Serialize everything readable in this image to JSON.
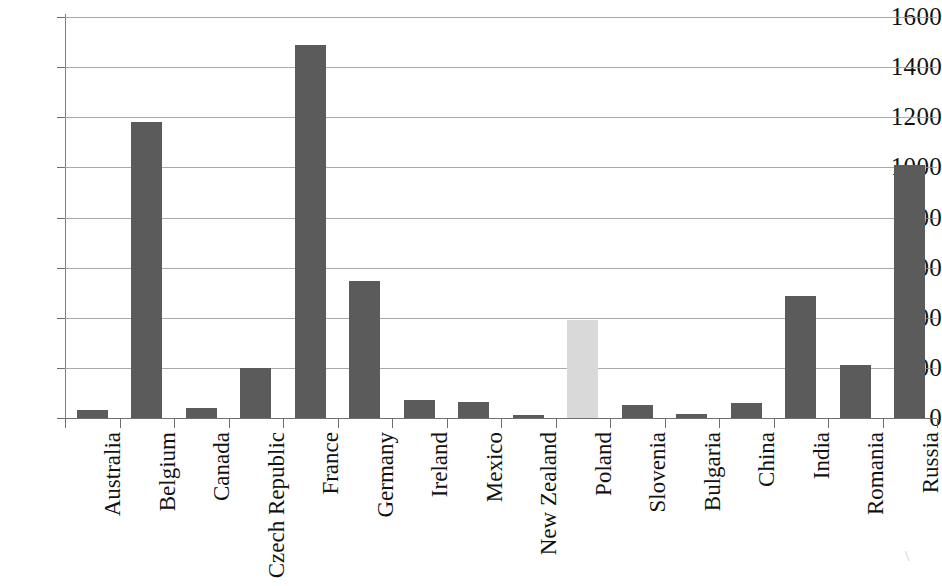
{
  "chart_data": {
    "type": "bar",
    "title": "",
    "subtitle": "",
    "xlabel": "",
    "ylabel": "",
    "ylim": [
      0,
      1600
    ],
    "ytick_step": 200,
    "yticks": [
      1600,
      1400,
      1200,
      1000,
      800,
      600,
      400,
      200,
      0
    ],
    "grid": true,
    "legend": "none",
    "categories": [
      "Australia",
      "Belgium",
      "Canada",
      "Czech Republic",
      "France",
      "Germany",
      "Ireland",
      "Mexico",
      "New Zealand",
      "Poland",
      "Slovenia",
      "Bulgaria",
      "China",
      "India",
      "Romania",
      "Russia"
    ],
    "values": [
      30,
      1180,
      38,
      200,
      1490,
      548,
      70,
      62,
      12,
      390,
      50,
      15,
      60,
      487,
      210,
      1010
    ],
    "highlight_category": "Poland",
    "bar_color": "#5b5b5b",
    "highlight_bar_color": "#d9d9d9",
    "gridline_color": "#9a9a9a",
    "axis_color": "#6f6f6f",
    "background_color": "#ffffff",
    "text_color": "#111111"
  }
}
